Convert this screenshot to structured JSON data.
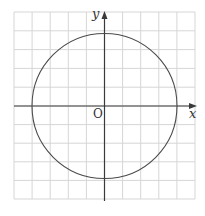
{
  "figure": {
    "grid": {
      "x_lines": [
        14,
        32.1,
        50.2,
        68.3,
        86.4,
        104.5,
        122.6,
        140.7,
        158.8,
        176.9,
        195
      ],
      "y_lines": [
        12,
        30.8,
        49.6,
        68.4,
        87.2,
        106,
        124.6,
        143.2,
        161.8,
        180.4,
        199
      ],
      "color": "#d4d4d4"
    },
    "axes": {
      "x_label": "x",
      "y_label": "y",
      "origin_label": "O",
      "color": "#3a3a3a"
    },
    "circle": {
      "center_units": [
        0,
        0
      ],
      "radius_units": 4,
      "color": "#4a4a4a"
    }
  }
}
